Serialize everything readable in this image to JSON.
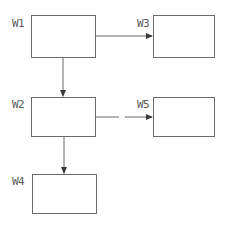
{
  "diagram": {
    "nodes": [
      {
        "id": "W1",
        "label": "W1",
        "x": 31,
        "y": 15,
        "w": 64,
        "h": 42
      },
      {
        "id": "W3",
        "label": "W3",
        "x": 153,
        "y": 15,
        "w": 61,
        "h": 42
      },
      {
        "id": "W2",
        "label": "W2",
        "x": 31,
        "y": 97,
        "w": 64,
        "h": 39
      },
      {
        "id": "W5",
        "label": "W5",
        "x": 153,
        "y": 97,
        "w": 61,
        "h": 39
      },
      {
        "id": "W4",
        "label": "W4",
        "x": 32,
        "y": 174,
        "w": 64,
        "h": 39
      }
    ],
    "edges": [
      {
        "from": "W1",
        "to": "W3",
        "direction": "right"
      },
      {
        "from": "W1",
        "to": "W2",
        "direction": "down"
      },
      {
        "from": "W2",
        "to": "W5",
        "direction": "right"
      },
      {
        "from": "W2",
        "to": "W4",
        "direction": "down"
      }
    ],
    "colors": {
      "stroke": "#6a6a6a",
      "arrow": "#3a3a3a",
      "text": "#5a5a5a"
    }
  }
}
